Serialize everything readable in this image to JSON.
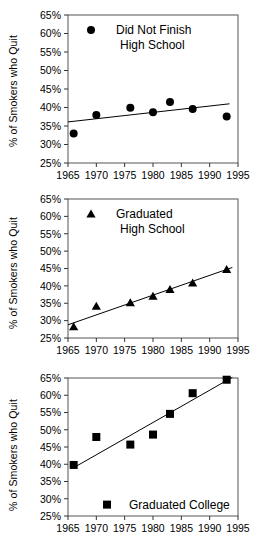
{
  "axis": {
    "ylabel": "% of Smokers who Quit",
    "yticks": [
      "25%",
      "30%",
      "35%",
      "40%",
      "45%",
      "50%",
      "55%",
      "60%",
      "65%"
    ],
    "xticks": [
      "1965",
      "1970",
      "1975",
      "1980",
      "1985",
      "1990",
      "1995"
    ]
  },
  "panels": [
    {
      "legend_line1": "Did Not Finish",
      "legend_line2": "High School",
      "marker": "circle-marker"
    },
    {
      "legend_line1": "Graduated",
      "legend_line2": "High School",
      "marker": "triangle-marker"
    },
    {
      "legend_line1": "Graduated College",
      "legend_line2": "",
      "marker": "square-marker"
    }
  ],
  "chart_data": [
    {
      "type": "scatter",
      "title": "Did Not Finish High School",
      "xlabel": "",
      "ylabel": "% of Smokers who Quit",
      "xlim": [
        1965,
        1995
      ],
      "ylim": [
        25,
        65
      ],
      "xticks": [
        1965,
        1970,
        1975,
        1980,
        1985,
        1990,
        1995
      ],
      "yticks": [
        25,
        30,
        35,
        40,
        45,
        50,
        55,
        60,
        65
      ],
      "grid": false,
      "legend_position": "top-left-inside",
      "marker": "filled circle",
      "x": [
        1966,
        1970,
        1976,
        1980,
        1983,
        1987,
        1993
      ],
      "values": [
        33.0,
        38.0,
        39.9,
        38.7,
        41.5,
        39.6,
        37.6
      ],
      "trendline": {
        "x": [
          1965,
          1993.5
        ],
        "y": [
          36.1,
          41.0
        ]
      }
    },
    {
      "type": "scatter",
      "title": "Graduated High School",
      "xlabel": "",
      "ylabel": "% of Smokers who Quit",
      "xlim": [
        1965,
        1995
      ],
      "ylim": [
        25,
        65
      ],
      "xticks": [
        1965,
        1970,
        1975,
        1980,
        1985,
        1990,
        1995
      ],
      "yticks": [
        25,
        30,
        35,
        40,
        45,
        50,
        55,
        60,
        65
      ],
      "grid": false,
      "legend_position": "top-left-inside",
      "marker": "filled triangle",
      "x": [
        1966,
        1970,
        1976,
        1980,
        1983,
        1987,
        1993
      ],
      "values": [
        28.2,
        34.1,
        35.1,
        37.0,
        38.9,
        40.8,
        44.7
      ],
      "trendline": {
        "x": [
          1965,
          1994
        ],
        "y": [
          28.8,
          45.3
        ]
      }
    },
    {
      "type": "scatter",
      "title": "Graduated College",
      "xlabel": "",
      "ylabel": "% of Smokers who Quit",
      "xlim": [
        1965,
        1995
      ],
      "ylim": [
        25,
        65
      ],
      "xticks": [
        1965,
        1970,
        1975,
        1980,
        1985,
        1990,
        1995
      ],
      "yticks": [
        25,
        30,
        35,
        40,
        45,
        50,
        55,
        60,
        65
      ],
      "grid": false,
      "legend_position": "bottom-center-inside",
      "marker": "filled square",
      "x": [
        1966,
        1970,
        1976,
        1980,
        1983,
        1987,
        1993
      ],
      "values": [
        39.8,
        47.9,
        45.7,
        48.6,
        54.6,
        60.6,
        64.5
      ],
      "trendline": {
        "x": [
          1966,
          1994
        ],
        "y": [
          39.0,
          65.2
        ]
      }
    }
  ]
}
